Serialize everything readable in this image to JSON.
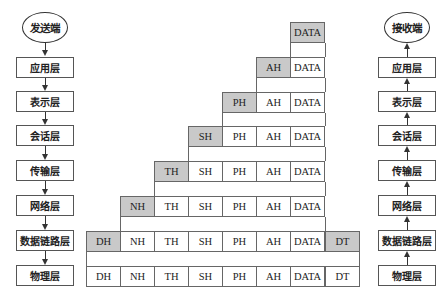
{
  "sender": {
    "label": "发送端",
    "layers": [
      "应用层",
      "表示层",
      "会话层",
      "传输层",
      "网络层",
      "数据链路层",
      "物理层"
    ]
  },
  "receiver": {
    "label": "接收端",
    "layers": [
      "应用层",
      "表示层",
      "会话层",
      "传输层",
      "网络层",
      "数据链路层",
      "物理层"
    ]
  },
  "encapsulation": {
    "colors": {
      "header_fill": "#c9c9c9",
      "plain_fill": "#ffffff",
      "border": "#666666"
    },
    "rows": [
      {
        "layer": "应用层",
        "cells": [
          {
            "text": "DATA",
            "shaded": true
          }
        ]
      },
      {
        "layer": "表示层",
        "cells": [
          {
            "text": "AH",
            "shaded": true
          },
          {
            "text": "DATA",
            "shaded": false
          }
        ]
      },
      {
        "layer": "会话层",
        "cells": [
          {
            "text": "PH",
            "shaded": true
          },
          {
            "text": "AH",
            "shaded": false
          },
          {
            "text": "DATA",
            "shaded": false
          }
        ]
      },
      {
        "layer": "传输层",
        "cells": [
          {
            "text": "SH",
            "shaded": true
          },
          {
            "text": "PH",
            "shaded": false
          },
          {
            "text": "AH",
            "shaded": false
          },
          {
            "text": "DATA",
            "shaded": false
          }
        ]
      },
      {
        "layer": "网络层",
        "cells": [
          {
            "text": "TH",
            "shaded": true
          },
          {
            "text": "SH",
            "shaded": false
          },
          {
            "text": "PH",
            "shaded": false
          },
          {
            "text": "AH",
            "shaded": false
          },
          {
            "text": "DATA",
            "shaded": false
          }
        ]
      },
      {
        "layer": "数据链路层",
        "cells": [
          {
            "text": "NH",
            "shaded": true
          },
          {
            "text": "TH",
            "shaded": false
          },
          {
            "text": "SH",
            "shaded": false
          },
          {
            "text": "PH",
            "shaded": false
          },
          {
            "text": "AH",
            "shaded": false
          },
          {
            "text": "DATA",
            "shaded": false
          }
        ]
      },
      {
        "layer": "数据链路层-frame",
        "cells": [
          {
            "text": "DH",
            "shaded": true
          },
          {
            "text": "NH",
            "shaded": false
          },
          {
            "text": "TH",
            "shaded": false
          },
          {
            "text": "SH",
            "shaded": false
          },
          {
            "text": "PH",
            "shaded": false
          },
          {
            "text": "AH",
            "shaded": false
          },
          {
            "text": "DATA",
            "shaded": false
          },
          {
            "text": "DT",
            "shaded": true
          }
        ]
      },
      {
        "layer": "物理层",
        "cells": [
          {
            "text": "DH",
            "shaded": false
          },
          {
            "text": "NH",
            "shaded": false
          },
          {
            "text": "TH",
            "shaded": false
          },
          {
            "text": "SH",
            "shaded": false
          },
          {
            "text": "PH",
            "shaded": false
          },
          {
            "text": "AH",
            "shaded": false
          },
          {
            "text": "DATA",
            "shaded": false
          },
          {
            "text": "DT",
            "shaded": false
          }
        ]
      }
    ]
  }
}
